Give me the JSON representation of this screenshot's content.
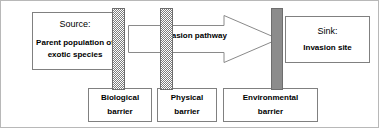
{
  "diagram": {
    "colors": {
      "background": "#ffffff",
      "box_border": "#808080",
      "outer_frame": "#b8b8b8",
      "hatch_gray": "#7d7d7d",
      "solid_bar_gray": "#8c8c8c",
      "text": "#000000"
    },
    "source": {
      "heading": "Source:",
      "line1": "Parent population of",
      "line2": "exotic species"
    },
    "sink": {
      "heading": "Sink:",
      "line1": "Invasion site"
    },
    "pathway": {
      "label": "Invasion pathway",
      "direction": "left-to-right"
    },
    "barriers": [
      {
        "id": "biological",
        "line1": "Biological",
        "line2": "barrier",
        "fill": "hatched"
      },
      {
        "id": "physical",
        "line1": "Physical",
        "line2": "barrier",
        "fill": "hatched"
      },
      {
        "id": "environmental",
        "line1": "Environmental",
        "line2": "barrier",
        "fill": "solid"
      }
    ]
  }
}
